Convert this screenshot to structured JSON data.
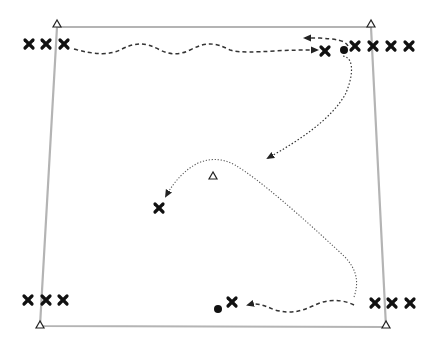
{
  "diagram": {
    "type": "soccer drill",
    "colors": {
      "field_line": "#b4b4b4",
      "player": "#111111",
      "path": "#333333",
      "background": "#ffffff"
    },
    "field": {
      "corners": [
        [
          57,
          27
        ],
        [
          371,
          27
        ],
        [
          386,
          327
        ],
        [
          40,
          326
        ]
      ]
    },
    "cones": [
      {
        "id": "cone-top-left",
        "x": 57,
        "y": 24
      },
      {
        "id": "cone-top-right",
        "x": 371,
        "y": 24
      },
      {
        "id": "cone-bottom-left",
        "x": 40,
        "y": 325
      },
      {
        "id": "cone-bottom-right",
        "x": 386,
        "y": 325
      },
      {
        "id": "cone-center",
        "x": 213,
        "y": 176
      }
    ],
    "players": [
      {
        "group": "top-left",
        "x": 29,
        "y": 44
      },
      {
        "group": "top-left",
        "x": 46,
        "y": 44
      },
      {
        "group": "top-left",
        "x": 64,
        "y": 44
      },
      {
        "group": "top-right-active",
        "x": 325,
        "y": 51
      },
      {
        "group": "top-right",
        "x": 355,
        "y": 46
      },
      {
        "group": "top-right",
        "x": 373,
        "y": 46
      },
      {
        "group": "top-right",
        "x": 391,
        "y": 46
      },
      {
        "group": "top-right",
        "x": 409,
        "y": 46
      },
      {
        "group": "center",
        "x": 159,
        "y": 208
      },
      {
        "group": "bottom-left",
        "x": 28,
        "y": 300
      },
      {
        "group": "bottom-left",
        "x": 46,
        "y": 300
      },
      {
        "group": "bottom-left",
        "x": 63,
        "y": 300
      },
      {
        "group": "bottom-center",
        "x": 232,
        "y": 302
      },
      {
        "group": "bottom-right",
        "x": 375,
        "y": 303
      },
      {
        "group": "bottom-right",
        "x": 392,
        "y": 303
      },
      {
        "group": "bottom-right",
        "x": 410,
        "y": 303
      }
    ],
    "balls": [
      {
        "x": 344,
        "y": 50
      },
      {
        "x": 218,
        "y": 309
      }
    ],
    "paths": [
      {
        "style": "dribble",
        "from": "top-left",
        "to": "top-right-active",
        "arrow": true
      },
      {
        "style": "dribble",
        "from": "top-right",
        "to": "top-left-direction",
        "arrow": true
      },
      {
        "style": "pass",
        "from": "top-right-ball",
        "to": "center-field",
        "arrow": true
      },
      {
        "style": "run",
        "from": "bottom-right",
        "to": "center-player",
        "arrow": true
      },
      {
        "style": "dribble",
        "from": "bottom-right",
        "to": "bottom-center",
        "arrow": true
      }
    ]
  }
}
